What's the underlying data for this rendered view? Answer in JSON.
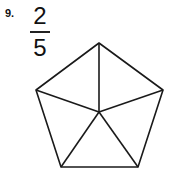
{
  "problem": {
    "number": "9.",
    "fraction": {
      "numerator": "2",
      "denominator": "5"
    }
  },
  "figure": {
    "shape": "pentagon",
    "parts": 5,
    "shaded_parts": 0,
    "stroke_color": "#1a1a1a"
  }
}
